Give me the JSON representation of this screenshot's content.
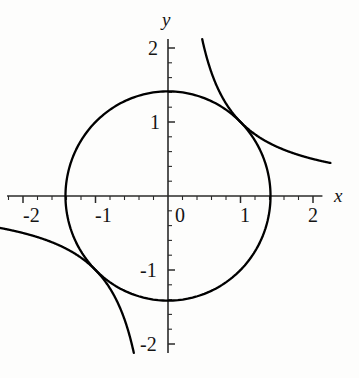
{
  "figure": {
    "background_color": "#fdfdfc",
    "curve_color": "#000000",
    "axis_color": "#2a2a2a",
    "width": 359,
    "height": 378
  },
  "axes": {
    "x_axis_label": "x",
    "y_axis_label": "y",
    "origin_px": {
      "x": 168,
      "y": 196
    },
    "px_per_unit_x": 72.5,
    "px_per_unit_y": 74,
    "x_range": [
      -2.22,
      2.13
    ],
    "y_range": [
      -2.12,
      2.12
    ],
    "x_tick_labels": [
      "-2",
      "-1",
      "0",
      "1",
      "2"
    ],
    "x_tick_values": [
      -2,
      -1,
      0,
      1,
      2
    ],
    "y_tick_labels": [
      "2",
      "1",
      "-1",
      "-2"
    ],
    "y_tick_values": [
      2,
      1,
      -1,
      -2
    ],
    "minor_tick_step": 0.2,
    "grid": false
  },
  "chart_data": {
    "type": "line",
    "title": "",
    "xlabel": "x",
    "ylabel": "y",
    "xlim": [
      -2.22,
      2.13
    ],
    "ylim": [
      -2.12,
      2.12
    ],
    "grid": false,
    "legend_position": "none",
    "series": [
      {
        "name": "circle x^2 + y^2 = 2",
        "kind": "implicit-circle",
        "center": [
          0,
          0
        ],
        "radius": 1.414,
        "x": [
          1.414,
          1.382,
          1.287,
          1.144,
          0.956,
          0.732,
          0.483,
          0.219,
          -0.051,
          -0.318,
          -0.571,
          -0.8,
          -0.995,
          -1.148,
          -1.254,
          -1.31,
          -1.314,
          -1.268,
          -1.173,
          -1.034,
          -0.856,
          -0.646,
          -0.413,
          -0.166,
          0.086,
          0.334,
          0.569,
          0.781,
          0.961,
          1.102,
          1.2,
          1.25,
          1.414
        ],
        "y": [
          0.0,
          0.298,
          0.586,
          0.833,
          1.04,
          1.21,
          1.329,
          1.397,
          1.413,
          1.378,
          1.294,
          1.166,
          1.005,
          0.824,
          0.653,
          0.532,
          0.0,
          -0.63,
          -0.789,
          -0.965,
          -1.125,
          -1.259,
          -1.352,
          -1.404,
          -1.411,
          -1.374,
          -1.294,
          -1.176,
          -1.037,
          -0.886,
          -0.747,
          -0.664,
          0.0
        ]
      },
      {
        "name": "hyperbola xy = 1 (branch I)",
        "kind": "implicit-hyperbola",
        "constant": 1,
        "x": [
          0.47,
          0.52,
          0.58,
          0.65,
          0.73,
          0.82,
          0.92,
          1.0,
          1.1,
          1.22,
          1.36,
          1.52,
          1.7,
          1.9,
          2.1,
          2.23
        ],
        "y": [
          2.128,
          1.923,
          1.724,
          1.538,
          1.37,
          1.22,
          1.087,
          1.0,
          0.909,
          0.82,
          0.735,
          0.658,
          0.588,
          0.526,
          0.476,
          0.448
        ]
      },
      {
        "name": "hyperbola xy = 1 (branch III)",
        "kind": "implicit-hyperbola",
        "constant": 1,
        "x": [
          -0.47,
          -0.52,
          -0.58,
          -0.65,
          -0.73,
          -0.82,
          -0.92,
          -1.0,
          -1.1,
          -1.22,
          -1.36,
          -1.52,
          -1.7,
          -1.9,
          -2.1,
          -2.23
        ],
        "y": [
          -2.128,
          -1.923,
          -1.724,
          -1.538,
          -1.37,
          -1.22,
          -1.087,
          -1.0,
          -0.909,
          -0.82,
          -0.735,
          -0.658,
          -0.588,
          -0.526,
          -0.476,
          -0.448
        ]
      }
    ],
    "intersections": [
      [
        1,
        1
      ],
      [
        -1,
        -1
      ]
    ]
  },
  "labels": {
    "x_neg2": "-2",
    "x_neg1": "-1",
    "x_zero": "0",
    "x_pos1": "1",
    "x_pos2": "2",
    "y_pos2": "2",
    "y_pos1": "1",
    "y_neg1": "-1",
    "y_neg2": "-2",
    "x_name": "x",
    "y_name": "y"
  }
}
